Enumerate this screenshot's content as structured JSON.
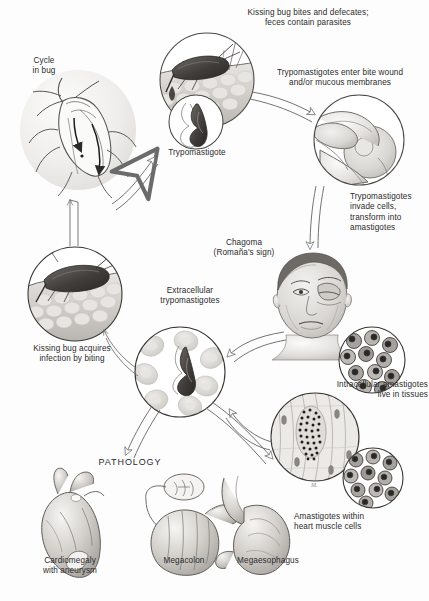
{
  "figure": {
    "background_color": "#fdfdfd",
    "ink_color": "#2b2b2b",
    "artist_signature": "M."
  },
  "labels": {
    "cycle_in_bug": "Cycle\nin bug",
    "bug_bites_defecates": "Kissing bug bites and defecates;\nfeces contain parasites",
    "trypomastigote": "Trypomastigote",
    "enter_bite_wound": "Trypomastigotes enter bite wound\nand/or mucous membranes",
    "invade_cells": "Trypomastigotes\ninvade cells,\ntransform into\namastigotes",
    "chagoma": "Chagoma\n(Romaña's sign)",
    "extracellular": "Extracellular\ntrypomastigotes",
    "bug_acquires": "Kissing bug acquires\ninfection by biting",
    "intracellular": "Intracellular amastigotes\nlive in tissues",
    "amastigotes_heart": "Amastigotes within\nheart muscle cells",
    "pathology": "PATHOLOGY",
    "cardiomegaly": "Cardiomegaly\nwith aneurysm",
    "megacolon": "Megacolon",
    "megaesophagus": "Megaesophagus"
  },
  "stages": [
    {
      "id": "bug-cycle",
      "name": "Cycle in bug",
      "cx": 70,
      "cy": 120,
      "r": 62
    },
    {
      "id": "bug-bite",
      "name": "Kissing bug bites and defecates",
      "cx": 207,
      "cy": 80,
      "r": 47
    },
    {
      "id": "trypomastigote",
      "name": "Trypomastigote inset",
      "cx": 196,
      "cy": 122,
      "r": 27
    },
    {
      "id": "eye-inoculation",
      "name": "Bite wound / mucous membranes",
      "cx": 359,
      "cy": 140,
      "r": 45
    },
    {
      "id": "chagoma-child",
      "name": "Chagoma (Romaña's sign)",
      "cx": 311,
      "cy": 300,
      "r": 48
    },
    {
      "id": "amastigote-inset",
      "name": "Intracellular amastigotes inset",
      "cx": 372,
      "cy": 360,
      "r": 33
    },
    {
      "id": "muscle-tissue",
      "name": "Amastigotes in tissue",
      "cx": 315,
      "cy": 437,
      "r": 44
    },
    {
      "id": "heart-amastigote",
      "name": "Amastigotes in heart muscle",
      "cx": 373,
      "cy": 478,
      "r": 30
    },
    {
      "id": "extracellular",
      "name": "Extracellular trypomastigotes",
      "cx": 180,
      "cy": 372,
      "r": 45
    },
    {
      "id": "bug-acquires",
      "name": "Kissing bug acquires infection",
      "cx": 75,
      "cy": 294,
      "r": 47
    }
  ],
  "organs": [
    {
      "id": "heart",
      "name": "Cardiomegaly with aneurysm"
    },
    {
      "id": "colon",
      "name": "Megacolon"
    },
    {
      "id": "esophagus",
      "name": "Megaesophagus"
    }
  ],
  "arrows": [
    {
      "from": "bug-cycle",
      "to": "bug-bite",
      "style": "outline"
    },
    {
      "from": "bug-bite",
      "to": "eye-inoculation",
      "style": "outline"
    },
    {
      "from": "eye-inoculation",
      "to": "chagoma-child",
      "style": "outline"
    },
    {
      "from": "chagoma-child",
      "to": "extracellular",
      "style": "outline"
    },
    {
      "from": "muscle-tissue",
      "to": "extracellular",
      "style": "outline"
    },
    {
      "from": "extracellular",
      "to": "muscle-tissue",
      "style": "outline"
    },
    {
      "from": "extracellular",
      "to": "bug-acquires",
      "style": "thin"
    },
    {
      "from": "extracellular",
      "to": "pathology",
      "style": "outline"
    },
    {
      "from": "bug-acquires",
      "to": "bug-cycle",
      "style": "thin"
    }
  ]
}
